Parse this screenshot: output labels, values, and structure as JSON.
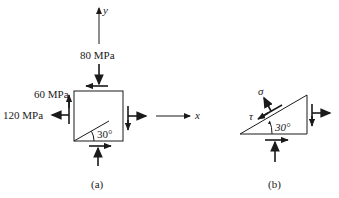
{
  "figure_a": {
    "caption": "(a)",
    "axis_y_label": "y",
    "axis_x_label": "x",
    "normal_stress_y": "80 MPa",
    "shear_stress": "60 MPa",
    "normal_stress_x": "120 MPa",
    "angle_label": "30°"
  },
  "figure_b": {
    "caption": "(b)",
    "normal_stress_symbol": "σ",
    "shear_stress_symbol": "τ",
    "angle_label": "30°"
  },
  "colors": {
    "ink": "#1a1a1a",
    "background": "#ffffff"
  }
}
